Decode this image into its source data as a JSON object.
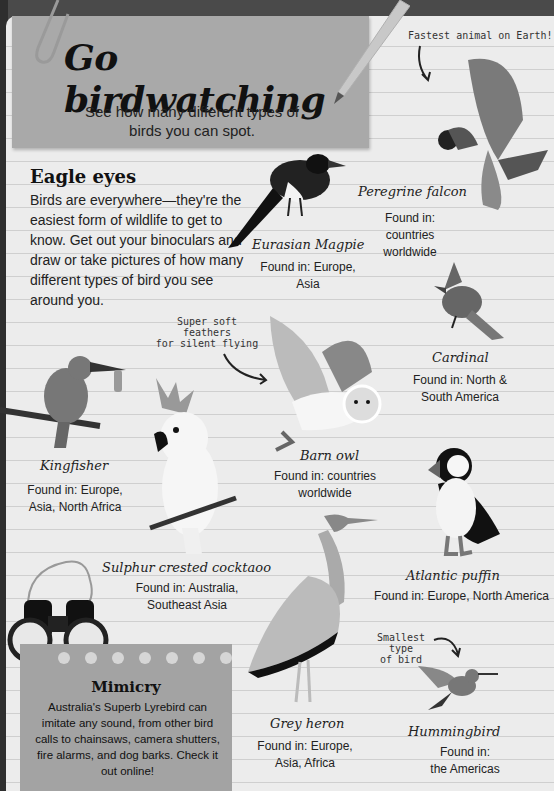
{
  "header": {
    "title": "Go birdwatching",
    "subtitle": "See how many different types of birds you can spot."
  },
  "intro": {
    "heading": "Eagle eyes",
    "body": "Birds are everywhere—they're the easiest form of wildlife to get to know. Get out your binoculars and draw or take pictures of how many different types of bird you see around you."
  },
  "annotations": {
    "falcon_note": "Fastest animal on Earth!",
    "owl_note_line1": "Super soft feathers",
    "owl_note_line2": "for silent flying",
    "hummingbird_note_line1": "Smallest type",
    "hummingbird_note_line2": "of bird"
  },
  "birds": [
    {
      "name": "Peregrine falcon",
      "found_line1": "Found in: countries",
      "found_line2": "worldwide",
      "icon": "falcon-icon"
    },
    {
      "name": "Eurasian Magpie",
      "found_line1": "Found in: Europe, Asia",
      "found_line2": "",
      "icon": "magpie-icon"
    },
    {
      "name": "Cardinal",
      "found_line1": "Found in: North &",
      "found_line2": "South America",
      "icon": "cardinal-icon"
    },
    {
      "name": "Barn owl",
      "found_line1": "Found in: countries worldwide",
      "found_line2": "",
      "icon": "owl-icon"
    },
    {
      "name": "Kingfisher",
      "found_line1": "Found in: Europe,",
      "found_line2": "Asia, North Africa",
      "icon": "kingfisher-icon"
    },
    {
      "name": "Atlantic puffin",
      "found_line1": "Found in: Europe, North America",
      "found_line2": "",
      "icon": "puffin-icon"
    },
    {
      "name": "Sulphur crested cocktaoo",
      "found_line1": "Found in: Australia,",
      "found_line2": "Southeast Asia",
      "icon": "cockatoo-icon"
    },
    {
      "name": "Grey heron",
      "found_line1": "Found in: Europe,",
      "found_line2": "Asia, Africa",
      "icon": "heron-icon"
    },
    {
      "name": "Hummingbird",
      "found_line1": "Found in:",
      "found_line2": "the Americas",
      "icon": "hummingbird-icon"
    }
  ],
  "mimicry": {
    "heading": "Mimicry",
    "body": "Australia's Superb Lyrebird can imitate any sound, from other bird calls to chainsaws, camera shutters, fire alarms, and dog barks. Check it out online!"
  },
  "colors": {
    "page": "#ececec",
    "card": "#a9a9a9",
    "ink": "#222222"
  }
}
